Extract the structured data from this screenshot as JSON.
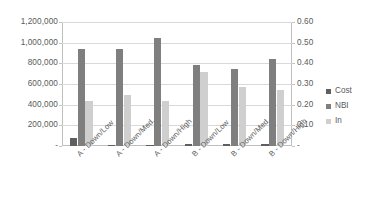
{
  "chart_data": {
    "type": "bar",
    "title": "",
    "xlabel": "",
    "ylabel": "",
    "grid": true,
    "legend_position": "right",
    "categories": [
      "A - Down/Low",
      "A - Down/Med.",
      "A - Down/High",
      "B - Down/Low",
      "B - Down/Med.",
      "B - Down/High"
    ],
    "series": [
      {
        "name": "Cost",
        "axis": "left",
        "color": "#5f5f5f",
        "values": [
          80000,
          8000,
          10000,
          15000,
          18000,
          22000
        ]
      },
      {
        "name": "NBI",
        "axis": "left",
        "color": "#7f7f7f",
        "values": [
          940000,
          940000,
          1050000,
          785000,
          750000,
          845000
        ]
      },
      {
        "name": "In",
        "axis": "right",
        "color": "#cfcfcf",
        "values": [
          0.22,
          0.245,
          0.22,
          0.36,
          0.285,
          0.27
        ]
      }
    ],
    "left_axis": {
      "min": 0,
      "max": 1200000,
      "step": 200000,
      "tick_labels": [
        "1,200,000",
        "1,000,000",
        "800,000",
        "600,000",
        "400,000",
        "200,000",
        "-"
      ]
    },
    "right_axis": {
      "min": 0,
      "max": 0.6,
      "step": 0.1,
      "tick_labels": [
        "0.60",
        "0.50",
        "0.40",
        "0.30",
        "0.20",
        "0.10",
        "-"
      ]
    }
  },
  "legend": {
    "items": [
      {
        "label": "Cost",
        "color": "#5f5f5f"
      },
      {
        "label": "NBI",
        "color": "#7f7f7f"
      },
      {
        "label": "In",
        "color": "#cfcfcf"
      }
    ]
  }
}
